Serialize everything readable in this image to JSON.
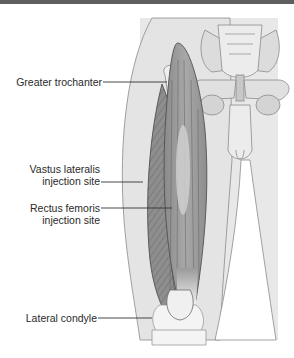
{
  "diagram": {
    "labels": {
      "greater_trochanter": "Greater trochanter",
      "vastus_lateralis_line1": "Vastus lateralis",
      "vastus_lateralis_line2": "injection site",
      "rectus_femoris_line1": "Rectus femoris",
      "rectus_femoris_line2": "injection site",
      "lateral_condyle": "Lateral condyle"
    },
    "colors": {
      "top_bar": "#5f5f5f",
      "body_fill": "#e6e6e6",
      "outline": "#8a8a8a",
      "vastus_lateralis": "#8c8c8c",
      "rectus_femoris": "#9a9a9a",
      "injection_highlight": "#cfcfcf",
      "bone": "#efefef",
      "text": "#2a2a2a"
    }
  }
}
